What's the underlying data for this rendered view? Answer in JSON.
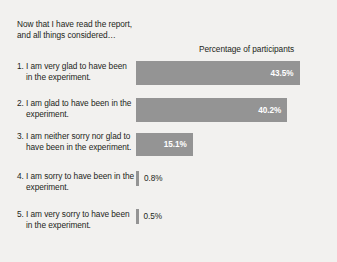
{
  "figure": {
    "background_color": "#f2f1ef",
    "bar_color": "#949494",
    "text_color": "#231f20",
    "in_bar_label_color": "#ffffff",
    "question_title": "Now that I have read the report,\nand all things considered…",
    "axis_title": "Percentage of participants"
  },
  "chart_data": {
    "type": "bar",
    "orientation": "horizontal",
    "title": "Now that I have read the report, and all things considered…",
    "xlabel": "Percentage of participants",
    "ylabel": "",
    "xlim": [
      0,
      50
    ],
    "grid": false,
    "legend": null,
    "categories": [
      "1. I am very glad to have been in the experiment.",
      "2. I am glad to have been in the experiment.",
      "3. I am neither sorry nor glad to have been in the experiment.",
      "4. I am sorry to have been in the experiment.",
      "5. I am very sorry to have been in the experiment."
    ],
    "values": [
      43.5,
      40.2,
      15.1,
      0.8,
      0.5
    ],
    "value_labels": [
      "43.5%",
      "40.2%",
      "15.1%",
      "0.8%",
      "0.5%"
    ]
  },
  "rows": [
    {
      "label": "1. I am very glad to have been in the experiment.",
      "value": 43.5,
      "value_label": "43.5%",
      "label_inside": true
    },
    {
      "label": "2. I am glad to have been in the experiment.",
      "value": 40.2,
      "value_label": "40.2%",
      "label_inside": true
    },
    {
      "label": "3. I am neither sorry nor glad to have been in the experiment.",
      "value": 15.1,
      "value_label": "15.1%",
      "label_inside": true
    },
    {
      "label": "4. I am sorry to have been in the experiment.",
      "value": 0.8,
      "value_label": "0.8%",
      "label_inside": false
    },
    {
      "label": "5. I am very sorry to have been in the experiment.",
      "value": 0.5,
      "value_label": "0.5%",
      "label_inside": false
    }
  ]
}
